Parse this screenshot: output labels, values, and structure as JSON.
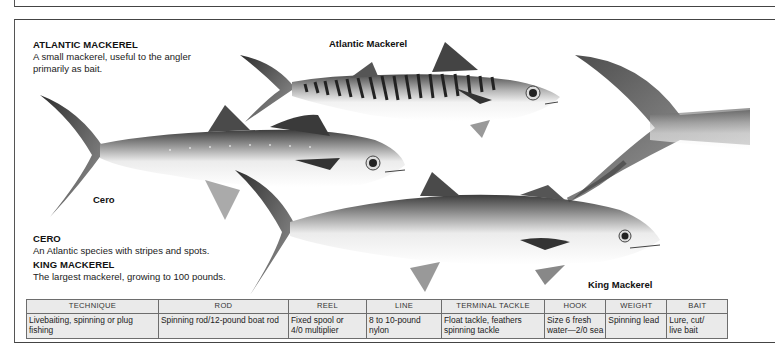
{
  "species": [
    {
      "name": "ATLANTIC MACKEREL",
      "description_line1": "A small mackerel, useful to the angler",
      "description_line2": "primarily as bait."
    },
    {
      "name": "CERO",
      "description_line1": "An Atlantic species with stripes and spots."
    },
    {
      "name": "KING MACKEREL",
      "description_line1": "The largest mackerel, growing to 100 pounds."
    }
  ],
  "illustration_labels": {
    "atlantic_mackerel": "Atlantic Mackerel",
    "cero": "Cero",
    "king_mackerel": "King Mackerel"
  },
  "tackle_table": {
    "headers": [
      "TECHNIQUE",
      "ROD",
      "REEL",
      "LINE",
      "TERMINAL TACKLE",
      "HOOK",
      "WEIGHT",
      "BAIT"
    ],
    "row": {
      "technique_l1": "Livebaiting, spinning or plug",
      "technique_l2": "fishing",
      "rod": "Spinning rod/12-pound boat rod",
      "reel_l1": "Fixed spool or",
      "reel_l2": "4/0 multiplier",
      "line_l1": "8 to 10-pound",
      "line_l2": "nylon",
      "terminal_l1": "Float tackle, feathers",
      "terminal_l2": "spinning tackle",
      "hook_l1": "Size 6 fresh",
      "hook_l2": "water—2/0 sea",
      "weight": "Spinning lead",
      "bait_l1": "Lure, cut/",
      "bait_l2": "live bait"
    }
  },
  "colors": {
    "table_bg": "#eaeaea",
    "table_border": "#6d6d6d",
    "text": "#1a1a1a",
    "fish_dark": "#3a3a3a",
    "fish_light": "#d8d8d8"
  }
}
